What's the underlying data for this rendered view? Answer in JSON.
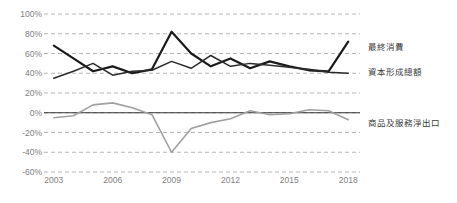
{
  "chart_data": {
    "type": "line",
    "title": "",
    "xlabel": "",
    "ylabel": "",
    "grid": true,
    "legend_position": "right-inline",
    "x": [
      2003,
      2004,
      2005,
      2006,
      2007,
      2008,
      2009,
      2010,
      2011,
      2012,
      2013,
      2014,
      2015,
      2016,
      2017,
      2018
    ],
    "xlim": [
      2002.5,
      2018.6
    ],
    "ylim": [
      -60,
      100
    ],
    "xtick_labels": [
      "2003",
      "2006",
      "2009",
      "2012",
      "2015",
      "2018"
    ],
    "xtick_values": [
      2003,
      2006,
      2009,
      2012,
      2015,
      2018
    ],
    "ytick_labels": [
      "100%",
      "80%",
      "60%",
      "40%",
      "20%",
      "0%",
      "-20%",
      "-40%",
      "-60%"
    ],
    "ytick_values": [
      100,
      80,
      60,
      40,
      20,
      0,
      -20,
      -40,
      -60
    ],
    "zero_line": 0,
    "series": [
      {
        "name": "最終消費",
        "color": "#1a1a1a",
        "width": 2.2,
        "label_x": 2018.9,
        "label_y": 66,
        "values": [
          68,
          55,
          42,
          47,
          40,
          44,
          82,
          60,
          47,
          55,
          45,
          52,
          47,
          43,
          42,
          72
        ]
      },
      {
        "name": "資本形成總額",
        "color": "#2b2b2b",
        "width": 1.5,
        "label_x": 2018.9,
        "label_y": 40,
        "values": [
          35,
          42,
          50,
          38,
          42,
          43,
          52,
          45,
          58,
          47,
          50,
          48,
          46,
          44,
          41,
          40
        ]
      },
      {
        "name": "商品及服務淨出口",
        "color": "#a0a0a0",
        "width": 1.6,
        "label_x": 2018.9,
        "label_y": -11,
        "values": [
          -5,
          -3,
          8,
          10,
          5,
          -2,
          -40,
          -16,
          -10,
          -6,
          2,
          -2,
          -1,
          3,
          2,
          -7
        ]
      }
    ]
  }
}
